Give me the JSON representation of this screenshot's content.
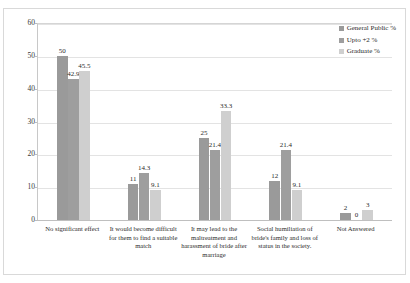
{
  "chart_data": {
    "type": "bar",
    "title": "",
    "xlabel": "",
    "ylabel": "",
    "ylim": [
      0,
      60
    ],
    "ytick_step": 10,
    "yticks": [
      "0",
      "10",
      "20",
      "30",
      "40",
      "50",
      "60"
    ],
    "grid": true,
    "legend_position": "top-right",
    "categories": [
      "No significant effect",
      "It would become difficult for them to find a suitable match",
      "It may lead to the maltreatment and harassment of bride after marriage",
      "Social humiliation of bride's family and loss of status in the society.",
      "Not Answered"
    ],
    "series": [
      {
        "name": "General Public %",
        "color": "#9a9a9a",
        "values": [
          50,
          11,
          25,
          12,
          2
        ],
        "labels": [
          "50",
          "11",
          "25",
          "12",
          "2"
        ]
      },
      {
        "name": "Upto +2 %",
        "color": "#9e9e9e",
        "values": [
          42.9,
          14.3,
          21.4,
          21.4,
          0
        ],
        "labels": [
          "42.9",
          "14.3",
          "21.4",
          "21.4",
          "0"
        ]
      },
      {
        "name": "Graduate %",
        "color": "#cfcfcf",
        "values": [
          45.5,
          9.1,
          33.3,
          9.1,
          3
        ],
        "labels": [
          "45.5",
          "9.1",
          "33.3",
          "9.1",
          "3"
        ]
      }
    ]
  },
  "legend": {
    "items": [
      {
        "label": "General Public %",
        "marker": "square-swatch-dark"
      },
      {
        "label": "Upto +2 %",
        "marker": "square-swatch-medium"
      },
      {
        "label": "Graduate %",
        "marker": "square-swatch-light"
      }
    ]
  }
}
